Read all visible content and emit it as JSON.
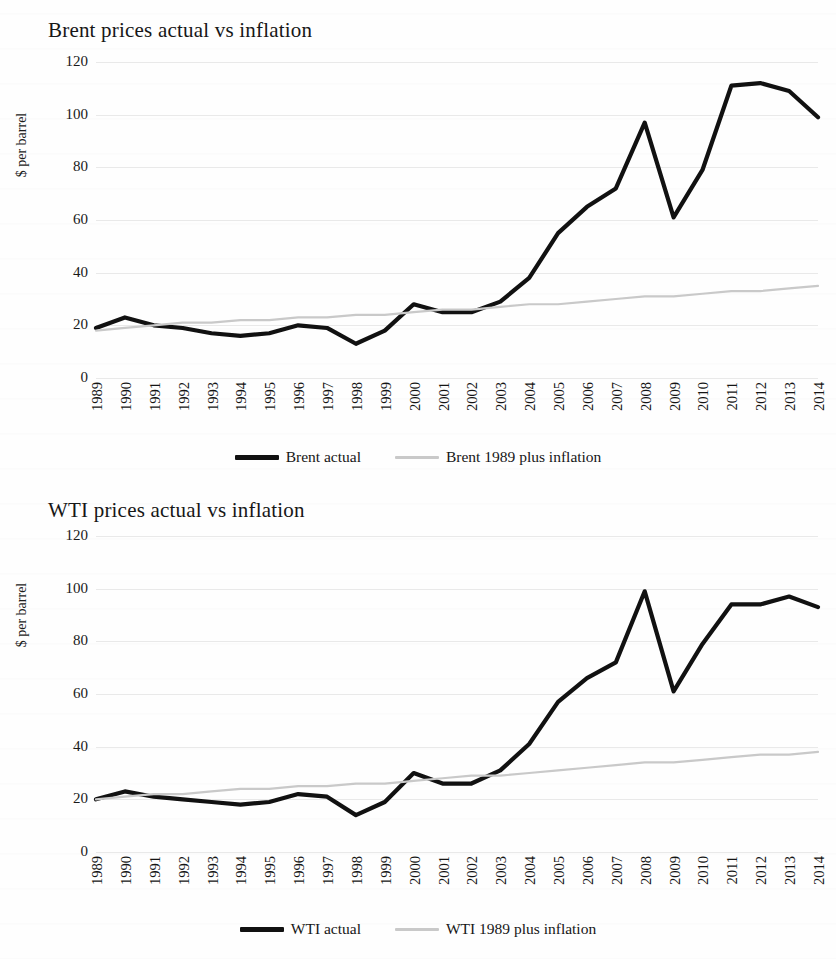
{
  "charts": [
    {
      "title": "Brent prices actual vs inflation",
      "ylabel": "$ per barrel",
      "legend": [
        {
          "label": "Brent actual",
          "color": "#111111",
          "style": "thick"
        },
        {
          "label": "Brent 1989 plus inflation",
          "color": "#c9c9c9",
          "style": "thin"
        }
      ],
      "chart_data": {
        "type": "line",
        "title": "Brent prices actual vs inflation",
        "xlabel": "",
        "ylabel": "$ per barrel",
        "ylim": [
          0,
          120
        ],
        "yticks": [
          0,
          20,
          40,
          60,
          80,
          100,
          120
        ],
        "grid": true,
        "legend_position": "bottom",
        "categories": [
          "1989",
          "1990",
          "1991",
          "1992",
          "1993",
          "1994",
          "1995",
          "1996",
          "1997",
          "1998",
          "1999",
          "2000",
          "2001",
          "2002",
          "2003",
          "2004",
          "2005",
          "2006",
          "2007",
          "2008",
          "2009",
          "2010",
          "2011",
          "2012",
          "2013",
          "2014"
        ],
        "series": [
          {
            "name": "Brent actual",
            "color": "#111111",
            "values": [
              19,
              23,
              20,
              19,
              17,
              16,
              17,
              20,
              19,
              13,
              18,
              28,
              25,
              25,
              29,
              38,
              55,
              65,
              72,
              97,
              61,
              79,
              111,
              112,
              109,
              99
            ]
          },
          {
            "name": "Brent 1989 plus inflation",
            "color": "#c9c9c9",
            "values": [
              18,
              19,
              20,
              21,
              21,
              22,
              22,
              23,
              23,
              24,
              24,
              25,
              26,
              26,
              27,
              28,
              28,
              29,
              30,
              31,
              31,
              32,
              33,
              33,
              34,
              35
            ]
          }
        ]
      }
    },
    {
      "title": "WTI prices actual vs inflation",
      "ylabel": "$ per barrel",
      "legend": [
        {
          "label": "WTI actual",
          "color": "#111111",
          "style": "thick"
        },
        {
          "label": "WTI 1989 plus inflation",
          "color": "#c9c9c9",
          "style": "thin"
        }
      ],
      "chart_data": {
        "type": "line",
        "title": "WTI prices actual vs inflation",
        "xlabel": "",
        "ylabel": "$ per barrel",
        "ylim": [
          0,
          120
        ],
        "yticks": [
          0,
          20,
          40,
          60,
          80,
          100,
          120
        ],
        "grid": true,
        "legend_position": "bottom",
        "categories": [
          "1989",
          "1990",
          "1991",
          "1992",
          "1993",
          "1994",
          "1995",
          "1996",
          "1997",
          "1998",
          "1999",
          "2000",
          "2001",
          "2002",
          "2003",
          "2004",
          "2005",
          "2006",
          "2007",
          "2008",
          "2009",
          "2010",
          "2011",
          "2012",
          "2013",
          "2014"
        ],
        "series": [
          {
            "name": "WTI actual",
            "color": "#111111",
            "values": [
              20,
              23,
              21,
              20,
              19,
              18,
              19,
              22,
              21,
              14,
              19,
              30,
              26,
              26,
              31,
              41,
              57,
              66,
              72,
              99,
              61,
              79,
              94,
              94,
              97,
              93
            ]
          },
          {
            "name": "WTI 1989 plus inflation",
            "color": "#c9c9c9",
            "values": [
              20,
              21,
              22,
              22,
              23,
              24,
              24,
              25,
              25,
              26,
              26,
              27,
              28,
              29,
              29,
              30,
              31,
              32,
              33,
              34,
              34,
              35,
              36,
              37,
              37,
              38
            ]
          }
        ]
      }
    }
  ]
}
